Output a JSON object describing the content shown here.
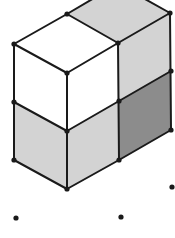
{
  "figure": {
    "colors": {
      "outline": "#1a1a1a",
      "white_face": "#ffffff",
      "light_face": "#d3d3d3",
      "dark_face": "#8c8c8c",
      "background": "#ffffff"
    },
    "grid_dots": [
      {
        "x": 16,
        "y": 218
      },
      {
        "x": 121,
        "y": 217
      },
      {
        "x": 172,
        "y": 187
      }
    ]
  }
}
